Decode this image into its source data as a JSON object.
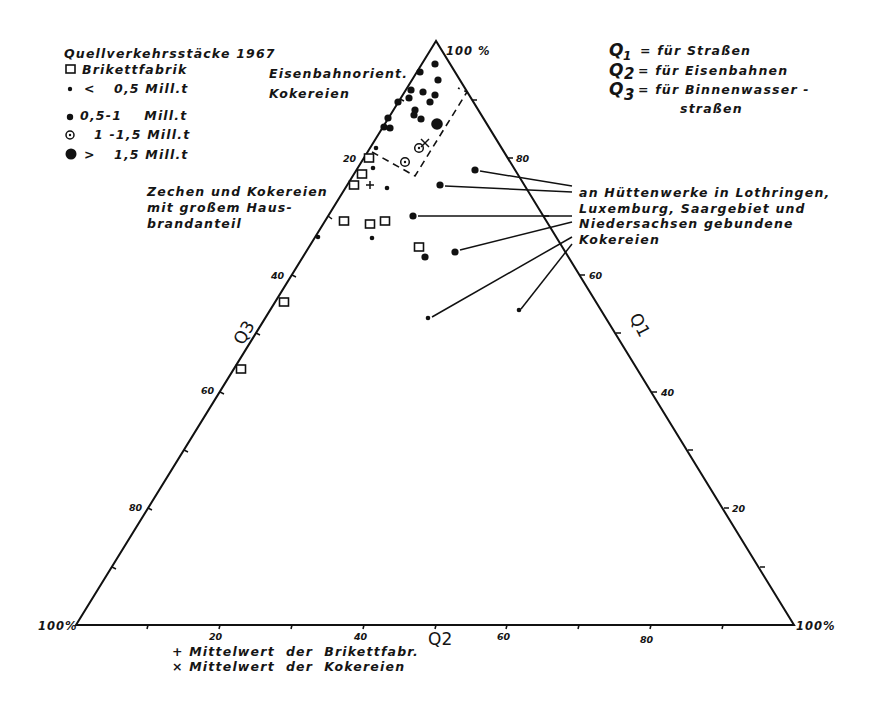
{
  "chart_data": {
    "type": "scatter",
    "subtype": "ternary",
    "title": "Quellverkehrsstäcke 1967",
    "axes": {
      "Q1": {
        "label": "Q1",
        "meaning": "für Straßen",
        "ticks": [
          20,
          40,
          60,
          80
        ],
        "side": "right"
      },
      "Q2": {
        "label": "Q2",
        "meaning": "für Eisenbahnen",
        "ticks": [
          20,
          40,
          60,
          80
        ],
        "side": "bottom"
      },
      "Q3": {
        "label": "Q3",
        "meaning": "für Binnenwasserstraßen",
        "ticks": [
          20,
          40,
          60,
          80
        ],
        "side": "left"
      }
    },
    "vertex_labels": [
      "100%",
      "100%",
      "100%"
    ],
    "legend": [
      {
        "symbol": "square",
        "label": "Brikettfabrik"
      },
      {
        "symbol": "small-dot",
        "label": "< 0,5 Mill.t"
      },
      {
        "symbol": "medium-dot",
        "label": "0,5-1 Mill.t"
      },
      {
        "symbol": "circle-dot",
        "label": "1 -1,5 Mill.t"
      },
      {
        "symbol": "large-dot",
        "label": "> 1,5 Mill.t"
      }
    ],
    "mean_markers": [
      {
        "symbol": "+",
        "label": "Mittelwert der Brikettfabr."
      },
      {
        "symbol": "x",
        "label": "Mittelwert der Kokereien"
      }
    ],
    "points_px": {
      "large": [
        [
          437,
          124
        ]
      ],
      "medium": [
        [
          435,
          64
        ],
        [
          420,
          72
        ],
        [
          438,
          80
        ],
        [
          423,
          92
        ],
        [
          411,
          90
        ],
        [
          435,
          95
        ],
        [
          430,
          102
        ],
        [
          409,
          98
        ],
        [
          398,
          102
        ],
        [
          415,
          110
        ],
        [
          388,
          118
        ],
        [
          421,
          119
        ],
        [
          414,
          115
        ],
        [
          384,
          127
        ],
        [
          390,
          128
        ],
        [
          475,
          170
        ],
        [
          440,
          185
        ],
        [
          413,
          216
        ],
        [
          455,
          252
        ],
        [
          425,
          257
        ]
      ],
      "small": [
        [
          376,
          148
        ],
        [
          373,
          168
        ],
        [
          387,
          188
        ],
        [
          318,
          237
        ],
        [
          372,
          238
        ],
        [
          428,
          318
        ],
        [
          519,
          310
        ]
      ],
      "circle_dot": [
        [
          419,
          148
        ],
        [
          405,
          162
        ]
      ],
      "square": [
        [
          369,
          158
        ],
        [
          362,
          174
        ],
        [
          354,
          185
        ],
        [
          344,
          221
        ],
        [
          370,
          224
        ],
        [
          385,
          221
        ],
        [
          419,
          247
        ],
        [
          284,
          302
        ],
        [
          241,
          369
        ]
      ],
      "plus": [
        [
          370,
          185
        ]
      ],
      "cross": [
        [
          425,
          143
        ]
      ]
    },
    "annotations": [
      "Eisenbahnorient. Kokereien",
      "Zechen und Kokereien mit großem Hausbrandanteil",
      "an Hüttenwerke in Lothringen, Luxemburg, Saargebiet und Niedersachsen gebundene Kokereien"
    ]
  },
  "legend": {
    "title": "Quellverkehrsstäcke 1967",
    "items": [
      {
        "label": "Brikettfabrik"
      },
      {
        "prefix": "<",
        "label": "0,5 Mill.t"
      },
      {
        "prefix": "",
        "label": "0,5-1    Mill.t"
      },
      {
        "prefix": "",
        "label": "1 -1,5 Mill.t"
      },
      {
        "prefix": ">",
        "label": "1,5 Mill.t"
      }
    ]
  },
  "key": {
    "q1": {
      "sym": "Q",
      "sub": "1",
      "text": "= für Straßen"
    },
    "q2": {
      "sym": "Q",
      "sub": "2",
      "text": "= für Eisenbahnen"
    },
    "q3": {
      "sym": "Q",
      "sub": "3",
      "text": "= für Binnenwasser -",
      "text2": "straßen"
    }
  },
  "annotations": {
    "eisenbahn": [
      "Eisenbahnorient.",
      "Kokereien"
    ],
    "zechen": [
      "Zechen und Kokereien",
      "mit großem Haus-",
      "brandanteil"
    ],
    "huetten": [
      "an Hüttenwerke in Lothringen,",
      "Luxemburg, Saargebiet und",
      "Niedersachsen gebundene",
      "Kokereien"
    ]
  },
  "axes": {
    "apex": "100 %",
    "left": "100%",
    "right": "100%",
    "q1": "Q1",
    "q2": "Q2",
    "q3": "Q3",
    "q1_ticks": [
      "80",
      "60",
      "40",
      "20"
    ],
    "q2_ticks": [
      "20",
      "40",
      "60",
      "80"
    ],
    "q3_ticks": [
      "20",
      "40",
      "60",
      "80"
    ]
  },
  "footer": {
    "plus": "+ Mittelwert  der  Brikettfabr.",
    "cross": "× Mittelwert  der  Kokereien"
  }
}
